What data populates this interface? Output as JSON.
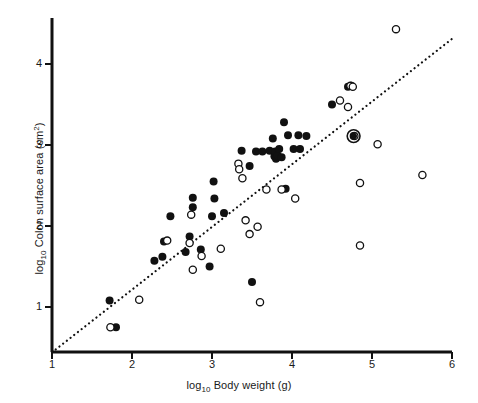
{
  "chart_data": {
    "type": "scatter",
    "title": "",
    "xlabel": "log10 Body weight (g)",
    "ylabel": "log10 Colon surface area (cm2)",
    "xlabel_parts": {
      "prefix": "log",
      "sub": "10",
      "rest": " Body weight (g)"
    },
    "ylabel_parts": {
      "prefix": "log",
      "sub": "10",
      "rest": " Colon surface area (cm",
      "sup": "2",
      "tail": ")"
    },
    "xlim": [
      1,
      6
    ],
    "ylim": [
      0.44,
      4.56
    ],
    "xticks": [
      1,
      2,
      3,
      4,
      5,
      6
    ],
    "yticks": [
      1,
      2,
      3,
      4
    ],
    "xtick_labels": [
      "1",
      "2",
      "3",
      "4",
      "5",
      "6"
    ],
    "ytick_labels": [
      "1",
      "2",
      "3",
      "4"
    ],
    "grid": false,
    "legend": false,
    "marker_colors": {
      "filled": "#111111",
      "open_stroke": "#111111",
      "open_fill": "#ffffff",
      "axis": "#111111",
      "trendline": "#111111"
    },
    "trendline": {
      "style": "dotted",
      "x_start": 1.0,
      "y_start": 0.44,
      "x_end": 6.0,
      "y_end": 4.31
    },
    "series": [
      {
        "name": "filled",
        "marker": "filled-circle",
        "points": [
          [
            1.72,
            1.08
          ],
          [
            1.8,
            0.75
          ],
          [
            2.28,
            1.57
          ],
          [
            2.38,
            1.62
          ],
          [
            2.4,
            1.81
          ],
          [
            2.48,
            2.12
          ],
          [
            2.67,
            1.68
          ],
          [
            2.72,
            1.87
          ],
          [
            2.76,
            2.35
          ],
          [
            2.76,
            2.23
          ],
          [
            2.86,
            1.71
          ],
          [
            2.97,
            1.5
          ],
          [
            3.0,
            2.12
          ],
          [
            3.02,
            2.55
          ],
          [
            3.03,
            2.34
          ],
          [
            3.15,
            2.16
          ],
          [
            3.37,
            2.93
          ],
          [
            3.47,
            2.74
          ],
          [
            3.5,
            1.31
          ],
          [
            3.55,
            2.92
          ],
          [
            3.63,
            2.92
          ],
          [
            3.72,
            2.93
          ],
          [
            3.76,
            3.08
          ],
          [
            3.78,
            2.86
          ],
          [
            3.79,
            2.92
          ],
          [
            3.8,
            2.83
          ],
          [
            3.81,
            2.85
          ],
          [
            3.82,
            2.87
          ],
          [
            3.84,
            2.95
          ],
          [
            3.87,
            2.85
          ],
          [
            3.9,
            3.28
          ],
          [
            3.92,
            2.46
          ],
          [
            3.95,
            3.12
          ],
          [
            4.02,
            2.95
          ],
          [
            4.08,
            3.12
          ],
          [
            4.1,
            2.95
          ],
          [
            4.18,
            3.11
          ],
          [
            4.5,
            3.5
          ],
          [
            4.7,
            3.72
          ],
          [
            4.74,
            3.73
          ],
          [
            4.77,
            3.11
          ]
        ]
      },
      {
        "name": "open",
        "marker": "open-circle",
        "points": [
          [
            1.73,
            0.75
          ],
          [
            2.09,
            1.09
          ],
          [
            2.44,
            1.82
          ],
          [
            2.72,
            1.79
          ],
          [
            2.74,
            2.14
          ],
          [
            2.76,
            1.46
          ],
          [
            2.87,
            1.63
          ],
          [
            3.11,
            1.72
          ],
          [
            3.33,
            2.77
          ],
          [
            3.34,
            2.7
          ],
          [
            3.38,
            2.59
          ],
          [
            3.42,
            2.07
          ],
          [
            3.47,
            1.9
          ],
          [
            3.57,
            1.99
          ],
          [
            3.6,
            1.06
          ],
          [
            3.68,
            2.45
          ],
          [
            3.87,
            2.45
          ],
          [
            4.04,
            2.34
          ],
          [
            4.6,
            3.55
          ],
          [
            4.7,
            3.47
          ],
          [
            4.73,
            3.73
          ],
          [
            4.76,
            3.72
          ],
          [
            4.78,
            3.11
          ],
          [
            4.85,
            2.53
          ],
          [
            4.85,
            1.76
          ],
          [
            5.07,
            3.01
          ],
          [
            5.3,
            4.43
          ],
          [
            5.63,
            2.63
          ]
        ]
      },
      {
        "name": "highlighted",
        "marker": "filled-circle-with-ring",
        "points": [
          [
            4.77,
            3.11
          ]
        ]
      }
    ]
  }
}
